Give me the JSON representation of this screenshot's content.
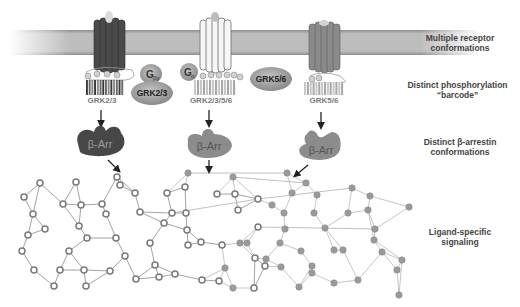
{
  "figure": {
    "type": "diagram"
  },
  "row_labels": [
    {
      "id": "receptor",
      "line1": "Multiple receptor",
      "line2": "conformations"
    },
    {
      "id": "barcode",
      "line1": "Distinct phosphorylation",
      "line2": "“barcode”"
    },
    {
      "id": "arrestin",
      "line1": "Distinct β-arrestin",
      "line2": "conformations"
    },
    {
      "id": "signaling",
      "line1": "Ligand-specific",
      "line2": "signaling"
    }
  ],
  "receptors": [
    {
      "id": "r1",
      "style": "dark",
      "color": "#4a4a4a",
      "barcode_label": "GRK2/3",
      "phospho": [
        "P",
        "P",
        "P",
        "P"
      ]
    },
    {
      "id": "r2",
      "style": "white",
      "color": "#f2f2f2",
      "barcode_label": "GRK2/3/5/6",
      "phospho": [
        "P",
        "P",
        "P",
        "P",
        "P",
        "P"
      ]
    },
    {
      "id": "r3",
      "style": "medium",
      "color": "#8a8a8a",
      "barcode_label": "GRK5/6",
      "phospho": [
        "P",
        "P"
      ]
    }
  ],
  "kinases": [
    {
      "id": "gby",
      "label": "G",
      "sub": "βγ",
      "color": "#a8a8a8"
    },
    {
      "id": "grk23",
      "label": "GRK2/3",
      "color": "#a0a0a0"
    },
    {
      "id": "galpha",
      "label": "G",
      "sub": "α",
      "color": "#8a8a8a"
    },
    {
      "id": "grk56",
      "label": "GRK5/6",
      "color": "#9a9a9a"
    }
  ],
  "arrestins": [
    {
      "id": "a1",
      "label": "β-Arr",
      "color": "#474747"
    },
    {
      "id": "a2",
      "label": "β-Arr",
      "color": "#8c8c8c"
    },
    {
      "id": "a3",
      "label": "β-Arr",
      "color": "#8c8c8c"
    }
  ],
  "colors": {
    "membrane": "#b5b5b5",
    "membrane_edge": "#8f8f8f",
    "node_hollow_stroke": "#7a7a7a",
    "node_filled": "#9a9a9a",
    "edge": "#9c9c9c",
    "arrow": "#222222",
    "label_text": "#444444",
    "barcode_text": "#7a7a7a"
  },
  "network": {
    "hollow_nodes": [
      [
        40,
        183
      ],
      [
        76,
        182
      ],
      [
        24,
        197
      ],
      [
        63,
        204
      ],
      [
        81,
        205
      ],
      [
        102,
        204
      ],
      [
        33,
        214
      ],
      [
        45,
        229
      ],
      [
        79,
        226
      ],
      [
        28,
        235
      ],
      [
        22,
        251
      ],
      [
        69,
        251
      ],
      [
        87,
        238
      ],
      [
        34,
        270
      ],
      [
        60,
        270
      ],
      [
        84,
        270
      ],
      [
        54,
        286
      ],
      [
        86,
        286
      ],
      [
        117,
        177
      ],
      [
        135,
        193
      ],
      [
        106,
        214
      ],
      [
        140,
        212
      ],
      [
        116,
        238
      ],
      [
        150,
        243
      ],
      [
        125,
        256
      ],
      [
        110,
        271
      ],
      [
        155,
        265
      ],
      [
        172,
        213
      ],
      [
        136,
        279
      ],
      [
        159,
        277
      ],
      [
        175,
        274
      ],
      [
        167,
        193
      ],
      [
        164,
        223
      ],
      [
        185,
        187
      ],
      [
        217,
        194
      ],
      [
        235,
        194
      ],
      [
        201,
        242
      ],
      [
        186,
        213
      ],
      [
        187,
        230
      ],
      [
        222,
        245
      ],
      [
        188,
        245
      ],
      [
        238,
        210
      ],
      [
        258,
        199
      ],
      [
        258,
        227
      ],
      [
        255,
        258
      ],
      [
        202,
        280
      ],
      [
        219,
        281
      ],
      [
        265,
        266
      ],
      [
        254,
        288
      ],
      [
        120,
        185
      ]
    ],
    "filled_nodes": [
      [
        188,
        173
      ],
      [
        233,
        177
      ],
      [
        287,
        173
      ],
      [
        306,
        183
      ],
      [
        292,
        193
      ],
      [
        317,
        195
      ],
      [
        272,
        205
      ],
      [
        284,
        213
      ],
      [
        352,
        188
      ],
      [
        370,
        196
      ],
      [
        368,
        210
      ],
      [
        409,
        207
      ],
      [
        314,
        213
      ],
      [
        348,
        213
      ],
      [
        285,
        229
      ],
      [
        247,
        243
      ],
      [
        325,
        228
      ],
      [
        375,
        229
      ],
      [
        280,
        243
      ],
      [
        374,
        240
      ],
      [
        301,
        251
      ],
      [
        334,
        250
      ],
      [
        240,
        243
      ],
      [
        266,
        259
      ],
      [
        281,
        267
      ],
      [
        312,
        266
      ],
      [
        343,
        250
      ],
      [
        382,
        252
      ],
      [
        402,
        260
      ],
      [
        397,
        270
      ],
      [
        399,
        295
      ],
      [
        358,
        280
      ],
      [
        312,
        273
      ],
      [
        233,
        288
      ],
      [
        299,
        287
      ],
      [
        225,
        268
      ],
      [
        334,
        283
      ]
    ]
  }
}
